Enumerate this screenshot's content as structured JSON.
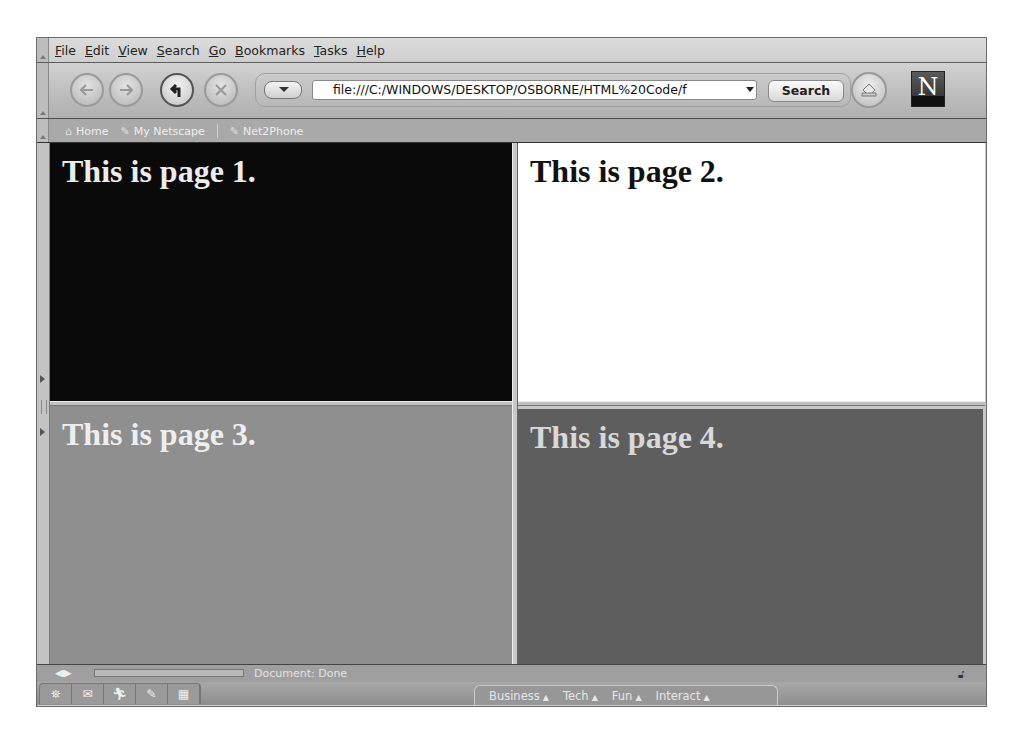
{
  "browser": {
    "menu": [
      "File",
      "Edit",
      "View",
      "Search",
      "Go",
      "Bookmarks",
      "Tasks",
      "Help"
    ],
    "nav": {
      "back_icon": "back-arrow-icon",
      "forward_icon": "forward-arrow-icon",
      "reload_icon": "reload-icon",
      "stop_icon": "stop-icon",
      "url": "file:///C:/WINDOWS/DESKTOP/OSBORNE/HTML%20Code/f",
      "search_label": "Search",
      "print_icon": "print-icon",
      "logo_letter": "N"
    },
    "personal_toolbar": [
      {
        "label": "Home",
        "icon": "home-icon"
      },
      {
        "label": "My Netscape",
        "icon": "bookmark-icon"
      },
      {
        "label": "Net2Phone",
        "icon": "bookmark-icon"
      }
    ],
    "status": {
      "text": "Document: Done"
    },
    "component_bar": {
      "icons": [
        "navigator-icon",
        "mail-icon",
        "instant-messenger-icon",
        "composer-icon",
        "address-book-icon"
      ],
      "tabs": [
        "Business",
        "Tech",
        "Fun",
        "Interact"
      ]
    }
  },
  "frames": [
    {
      "heading": "This is page 1.",
      "bg": "#0a0a0a",
      "color": "#ececec"
    },
    {
      "heading": "This is page 2.",
      "bg": "#ffffff",
      "color": "#111111"
    },
    {
      "heading": "This is page 3.",
      "bg": "#8f8f8f",
      "color": "#eeeeee"
    },
    {
      "heading": "This is page 4.",
      "bg": "#5e5e5e",
      "color": "#d8d8d8"
    }
  ]
}
